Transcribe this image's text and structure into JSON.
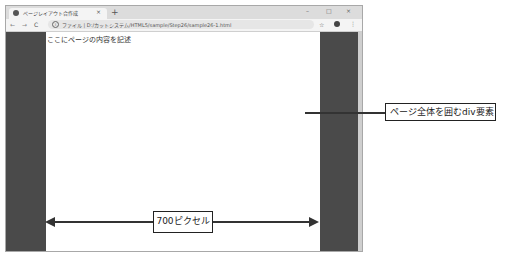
{
  "browser": {
    "tab_title": "ページレイアウト合作成",
    "tab_close": "×",
    "new_tab": "+",
    "window_controls": {
      "minimize": "–",
      "maximize": "□",
      "close": "×"
    },
    "nav": {
      "back": "←",
      "forward": "→",
      "reload": "C"
    },
    "info_icon": "i",
    "url": "ファイル | D:/カットシステム/HTML5/sample/Step26/sample26-1.html",
    "star": "☆",
    "menu": "⋮"
  },
  "page": {
    "body_text": "ここにページの内容を記述"
  },
  "annotations": {
    "callout_label": "ページ全体を囲むdiv要素",
    "width_label": "700ピクセル"
  },
  "colors": {
    "side_band": "#4a4a4a",
    "content_bg": "#ffffff",
    "tabbar_bg": "#dcdcdc"
  }
}
